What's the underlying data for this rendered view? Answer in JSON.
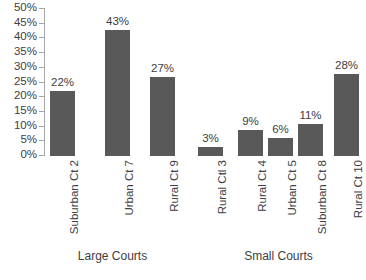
{
  "chart_data": {
    "type": "bar",
    "title": "",
    "subtitle": "",
    "xlabel": "",
    "ylabel": "",
    "ylim": [
      0,
      50
    ],
    "grid": false,
    "legend": null,
    "bar_color": "#595959",
    "axis_color": "#a6a6a6",
    "text_color": "#404040",
    "y_ticks": [
      "0%",
      "5%",
      "10%",
      "15%",
      "20%",
      "25%",
      "30%",
      "35%",
      "40%",
      "45%",
      "50%"
    ],
    "y_tick_values": [
      0,
      5,
      10,
      15,
      20,
      25,
      30,
      35,
      40,
      45,
      50
    ],
    "categories": [
      "Suburban Ct 2",
      "Urban Ct 7",
      "Rural Ct 9",
      "Rural Ctl 3",
      "Rural Ct 4",
      "Urban Ct 5",
      "Suburban Ct 8",
      "Rural Ct 10"
    ],
    "values": [
      22,
      43,
      27,
      3,
      9,
      6,
      11,
      28
    ],
    "value_labels": [
      "22%",
      "43%",
      "27%",
      "3%",
      "9%",
      "6%",
      "11%",
      "28%"
    ],
    "groups": [
      {
        "label": "Large Courts",
        "start_index": 0,
        "count": 3
      },
      {
        "label": "Small Courts",
        "start_index": 3,
        "count": 5
      }
    ]
  }
}
